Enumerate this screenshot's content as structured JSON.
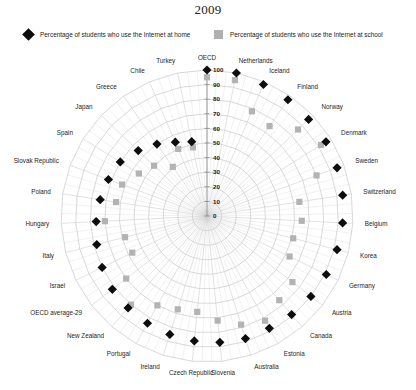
{
  "title": "2009",
  "legend": {
    "home": {
      "label": "Percentage of students who use the Internet at home",
      "marker": "diamond-marker",
      "color": "#0d0d0d"
    },
    "school": {
      "label": "Percentage of students who use the Internet at school",
      "marker": "square-marker",
      "color": "#b0b0b0"
    }
  },
  "chart_data": {
    "type": "scatter",
    "projection": "polar",
    "title": "2009",
    "xlabel": "",
    "ylabel": "",
    "rlim": [
      0,
      100
    ],
    "rticks": [
      0,
      10,
      20,
      30,
      40,
      50,
      60,
      70,
      80,
      90,
      100
    ],
    "rtick_labels": [
      "0",
      "10",
      "20",
      "30",
      "40",
      "50",
      "60",
      "70",
      "80",
      "90",
      "100"
    ],
    "grid": true,
    "legend_position": "top",
    "categories": [
      "OECD",
      "Netherlands",
      "Iceland",
      "Finland",
      "Norway",
      "Denmark",
      "Sweden",
      "Switzerland",
      "Belgium",
      "Korea",
      "Germany",
      "Austria",
      "Canada",
      "Estonia",
      "Australia",
      "Slovenia",
      "Czech Republic",
      "Ireland",
      "Portugal",
      "New Zealand",
      "OECD average-29",
      "Israel",
      "Italy",
      "Hungary",
      "Poland",
      "Slovak Republic",
      "Spain",
      "Japan",
      "Greece",
      "Chile",
      "Turkey"
    ],
    "series": [
      {
        "name": "Percentage of students who use the Internet at home",
        "marker": "diamond",
        "color": "#0d0d0d",
        "values": [
          100,
          100,
          98,
          97,
          96,
          96,
          95,
          94,
          93,
          92,
          91,
          90,
          89,
          88,
          88,
          87,
          86,
          85,
          84,
          83,
          82,
          80,
          78,
          76,
          74,
          72,
          70,
          65,
          60,
          55,
          52
        ]
      },
      {
        "name": "Percentage of students who use the Internet at school",
        "marker": "square",
        "color": "#b3b3b3",
        "values": [
          95,
          95,
          78,
          75,
          86,
          92,
          80,
          64,
          65,
          61,
          63,
          74,
          76,
          82,
          78,
          72,
          66,
          67,
          70,
          80,
          70,
          57,
          58,
          70,
          63,
          62,
          55,
          50,
          41,
          50,
          48
        ]
      }
    ]
  }
}
